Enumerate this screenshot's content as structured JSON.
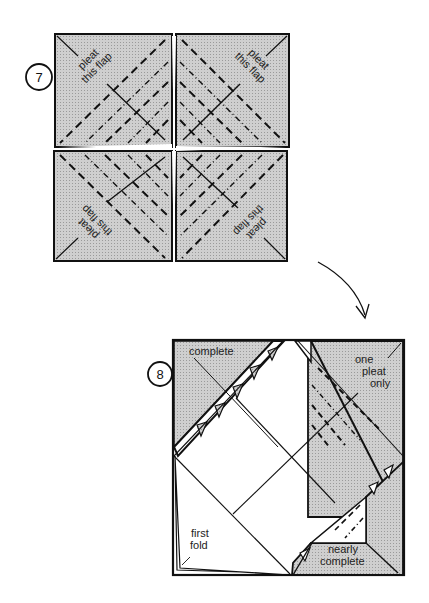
{
  "diagram": {
    "steps": [
      {
        "number": "7",
        "flap_labels": [
          {
            "line1": "pleat",
            "line2": "this flap",
            "position": "top-left"
          },
          {
            "line1": "pleat",
            "line2": "this flap",
            "position": "top-right"
          },
          {
            "line1": "pleat",
            "line2": "this flap",
            "position": "bottom-left"
          },
          {
            "line1": "pleat",
            "line2": "this flap",
            "position": "bottom-right"
          }
        ]
      },
      {
        "number": "8",
        "labels": {
          "complete": "complete",
          "one_pleat_line1": "one",
          "one_pleat_line2": "pleat",
          "one_pleat_line3": "only",
          "first_fold_line1": "first",
          "first_fold_line2": "fold",
          "nearly_line1": "nearly",
          "nearly_line2": "complete"
        }
      }
    ],
    "colors": {
      "shade": "#c9c9c9",
      "line": "#1a1a1a",
      "paper": "#ffffff"
    }
  }
}
